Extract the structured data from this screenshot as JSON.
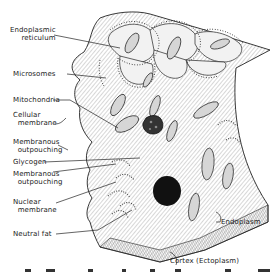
{
  "figure": {
    "labels": {
      "endoplasmic_reticulum": "Endoplasmic\n reticulum",
      "microsomes": "Microsomes",
      "mitochondria": "Mitochondria",
      "cellular_membrane": "Cellular\n  membrane",
      "membranous_outpouching_1": "Membranous\n  outpouching",
      "glycogen": "Glycogen",
      "membranous_outpouching_2": "Membranous\n  outpouching",
      "nuclear_membrane": "Nuclear\n  membrane",
      "neutral_fat": "Neutral fat",
      "endoplasm": "Endoplasm",
      "cortex": "Cortex (Ectoplasm)"
    },
    "colors": {
      "ink": "#222222",
      "shading": "#b8b8b8",
      "paper": "#ffffff"
    }
  }
}
